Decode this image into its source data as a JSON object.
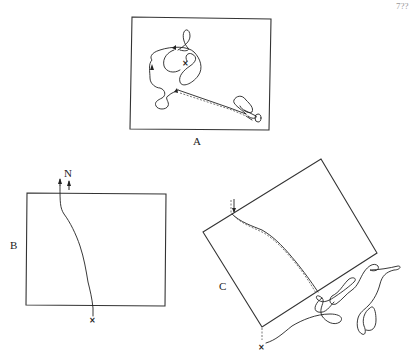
{
  "page": {
    "page_number": "7??"
  },
  "figures": [
    {
      "id": "A",
      "label": "A",
      "description": "Rectangular field with a looping searching track starting at x, with arrows, a dashed straight run toward the lower right, and a small loop cluster at the goal",
      "start_marker": "×"
    },
    {
      "id": "B",
      "label": "B",
      "description": "Rectangular field with a nearly straight track from x at bottom to top edge, with arrows pointing north",
      "north_label": "N",
      "start_marker": "×"
    },
    {
      "id": "C",
      "label": "C",
      "description": "Rotated rectangular field; track starts at x below the lower corner, wanders in loops outside the right side, then runs diagonally across (solid and dashed lines) to the upper-left edge with a downward arrow",
      "start_marker": "×"
    }
  ]
}
